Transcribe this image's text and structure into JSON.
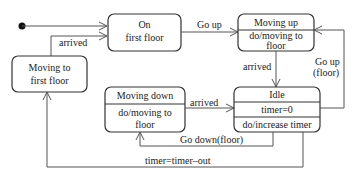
{
  "diagram": {
    "type": "UML state machine",
    "states": {
      "on_first_floor": {
        "line1": "On",
        "line2": "first floor"
      },
      "moving_to_first_floor": {
        "line1": "Moving to",
        "line2": "first floor"
      },
      "moving_up": {
        "name": "Moving up",
        "activity1": "do/moving to",
        "activity2": "floor"
      },
      "moving_down": {
        "name": "Moving down",
        "activity1": "do/moving to",
        "activity2": "floor"
      },
      "idle": {
        "name": "Idle",
        "variable": "timer=0",
        "activity": "do/increase timer"
      }
    },
    "transitions": {
      "initial_to_on": "",
      "moving_to_first_to_on": "arrived",
      "on_to_moving_up": "Go up",
      "moving_up_to_idle": "arrived",
      "idle_to_moving_up_line1": "Go up",
      "idle_to_moving_up_line2": "(floor)",
      "moving_down_to_idle": "arrived",
      "idle_to_moving_down": "Go down(floor)",
      "idle_to_moving_to_first": "timer=timer–out"
    }
  }
}
